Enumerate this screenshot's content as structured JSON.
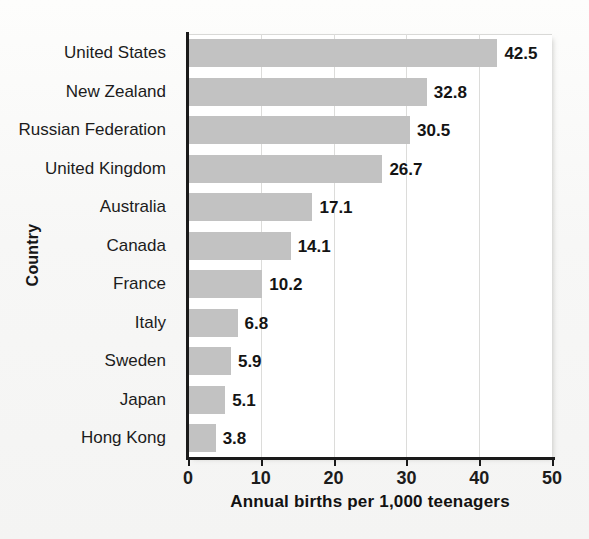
{
  "chart_data": {
    "type": "bar",
    "orientation": "horizontal",
    "title": "",
    "xlabel": "Annual births per 1,000 teenagers",
    "ylabel": "Country",
    "xlim": [
      0,
      50
    ],
    "xticks": [
      0,
      10,
      20,
      30,
      40,
      50
    ],
    "xtick_labels": [
      "0",
      "10",
      "20",
      "30",
      "40",
      "50"
    ],
    "grid": "vertical",
    "legend": "none",
    "bar_color": "#c2c2c2",
    "categories": [
      "United States",
      "New Zealand",
      "Russian Federation",
      "United Kingdom",
      "Australia",
      "Canada",
      "France",
      "Italy",
      "Sweden",
      "Japan",
      "Hong Kong"
    ],
    "values": [
      42.5,
      32.8,
      30.5,
      26.7,
      17.1,
      14.1,
      10.2,
      6.8,
      5.9,
      5.1,
      3.8
    ],
    "value_labels": [
      "42.5",
      "32.8",
      "30.5",
      "26.7",
      "17.1",
      "14.1",
      "10.2",
      "6.8",
      "5.9",
      "5.1",
      "3.8"
    ]
  }
}
